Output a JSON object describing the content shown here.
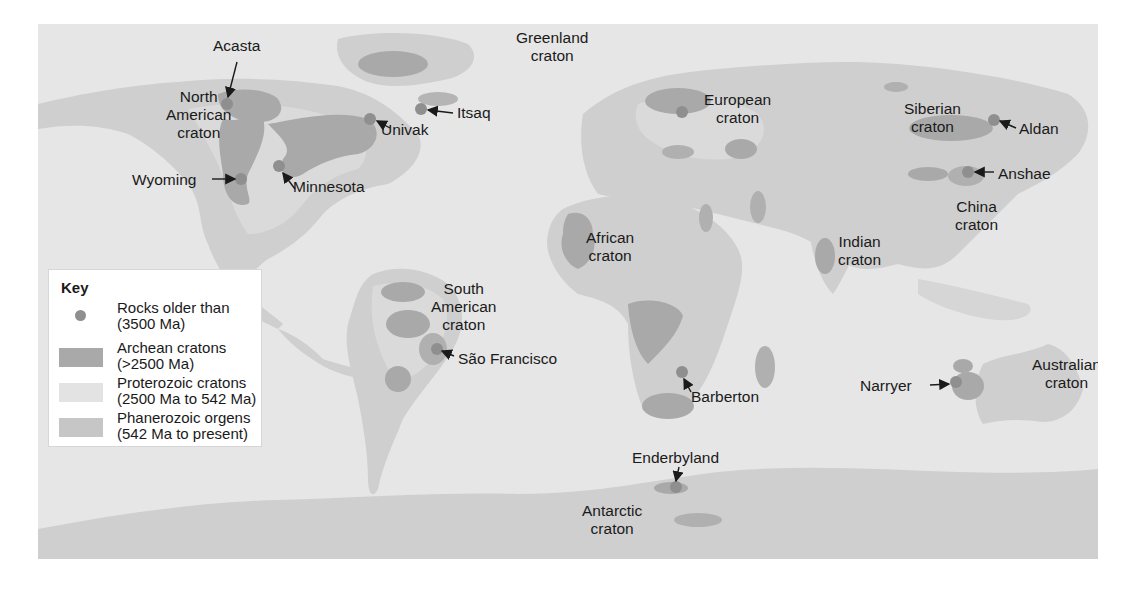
{
  "colors": {
    "ocean": "#e6e6e6",
    "phanerozoic": "#cfcfcf",
    "proterozoic": "#dcdcdc",
    "archean": "#a9a9a9",
    "old_rock": "#8f8f8f",
    "text": "#1a1a1a"
  },
  "key": {
    "title": "Key",
    "items": [
      {
        "line1": "Rocks older than",
        "line2": "(3500 Ma)",
        "symbol": "dot"
      },
      {
        "line1": "Archean cratons",
        "line2": "(>2500 Ma)",
        "symbol": "dark-swatch"
      },
      {
        "line1": "Proterozoic cratons",
        "line2": "(2500 Ma to 542 Ma)",
        "symbol": "light-swatch"
      },
      {
        "line1": "Phanerozoic orgens",
        "line2": "(542 Ma to present)",
        "symbol": "medium-swatch"
      }
    ]
  },
  "cratons": [
    {
      "l1": "North",
      "l2": "American",
      "l3": "craton"
    },
    {
      "l1": "Greenland",
      "l2": "craton"
    },
    {
      "l1": "European",
      "l2": "craton"
    },
    {
      "l1": "Siberian",
      "l2": "craton"
    },
    {
      "l1": "China",
      "l2": "craton"
    },
    {
      "l1": "Indian",
      "l2": "craton"
    },
    {
      "l1": "African",
      "l2": "craton"
    },
    {
      "l1": "South",
      "l2": "American",
      "l3": "craton"
    },
    {
      "l1": "Australian",
      "l2": "craton"
    },
    {
      "l1": "Antarctic",
      "l2": "craton"
    }
  ],
  "sites": [
    {
      "name": "Acasta"
    },
    {
      "name": "Wyoming"
    },
    {
      "name": "Minnesota"
    },
    {
      "name": "Univak"
    },
    {
      "name": "Itsaq"
    },
    {
      "name": "Aldan"
    },
    {
      "name": "Anshae"
    },
    {
      "name": "São Francisco"
    },
    {
      "name": "Barberton"
    },
    {
      "name": "Narryer"
    },
    {
      "name": "Enderbyland"
    }
  ]
}
